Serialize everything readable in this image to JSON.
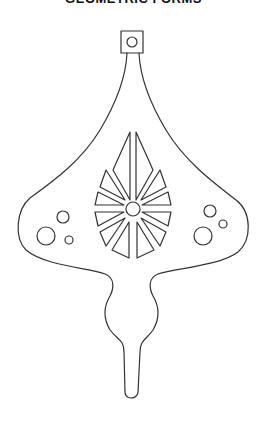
{
  "title": "GEOMETRIC FORMS",
  "artwork": {
    "subject": "ornament-stencil",
    "stroke_color": "#333333",
    "background": "#ffffff",
    "elements": [
      "hanger-loop",
      "hanger-hole",
      "ornament-body",
      "central-rosette",
      "rosette-center-circle",
      "left-circle-cluster",
      "right-circle-cluster",
      "bulb-stem"
    ]
  }
}
